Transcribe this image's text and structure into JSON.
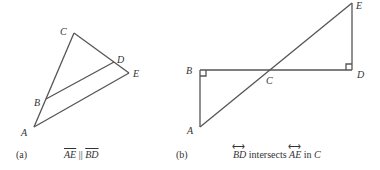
{
  "figure_a": {
    "points": {
      "A": {
        "label": "A",
        "x": 34,
        "y": 127
      },
      "B": {
        "label": "B",
        "x": 46,
        "y": 100
      },
      "C": {
        "label": "C",
        "x": 74,
        "y": 33
      },
      "D": {
        "label": "D",
        "x": 114,
        "y": 62
      },
      "E": {
        "label": "E",
        "x": 129,
        "y": 73
      }
    },
    "caption_id": "(a)",
    "caption_seg1": "AE",
    "caption_rel": "||",
    "caption_seg2": "BD"
  },
  "figure_b": {
    "points": {
      "A": {
        "label": "A",
        "x": 200,
        "y": 127
      },
      "B": {
        "label": "B",
        "x": 200,
        "y": 70
      },
      "C": {
        "label": "C",
        "x": 270,
        "y": 70
      },
      "D": {
        "label": "D",
        "x": 352,
        "y": 70
      },
      "E": {
        "label": "E",
        "x": 353,
        "y": 3
      }
    },
    "caption_id": "(b)",
    "caption_line1": "BD",
    "caption_mid": "intersects",
    "caption_line2": "AE",
    "caption_in": "in",
    "caption_point": "C"
  },
  "colors": {
    "stroke": "#555555",
    "text": "#333333"
  }
}
